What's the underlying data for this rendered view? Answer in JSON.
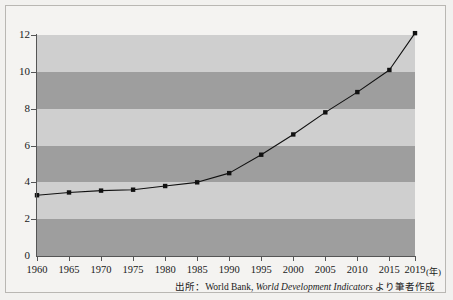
{
  "chart_data": {
    "type": "line",
    "title": "",
    "xlabel": "(年)",
    "ylabel": "",
    "x": [
      1960,
      1965,
      1970,
      1975,
      1980,
      1985,
      1990,
      1995,
      2000,
      2005,
      2010,
      2015,
      2019
    ],
    "values": [
      3.3,
      3.45,
      3.55,
      3.6,
      3.8,
      4.0,
      4.5,
      5.5,
      6.6,
      7.8,
      8.9,
      10.1,
      12.1
    ],
    "series": [
      {
        "name": "",
        "values": [
          3.3,
          3.45,
          3.55,
          3.6,
          3.8,
          4.0,
          4.5,
          5.5,
          6.6,
          7.8,
          8.9,
          10.1,
          12.1
        ]
      }
    ],
    "xtick_labels": [
      "1960",
      "1965",
      "1970",
      "1975",
      "1980",
      "1985",
      "1990",
      "1995",
      "2000",
      "2005",
      "2010",
      "2015",
      "2019"
    ],
    "ytick_labels": [
      "0",
      "2",
      "4",
      "6",
      "8",
      "10",
      "12"
    ],
    "ytick_values": [
      0,
      2,
      4,
      6,
      8,
      10,
      12
    ],
    "ylim": [
      0,
      12
    ],
    "xlim": [
      1960,
      2019
    ],
    "grid": false,
    "banded_background": true,
    "band_colors": {
      "dark": "#9e9e9e",
      "light": "#cfcfcf"
    },
    "marker": "square",
    "marker_color": "#111111",
    "line_color": "#111111",
    "legend": null
  },
  "axis": {
    "y_unit": "",
    "x_unit": "(年)"
  },
  "source": {
    "prefix": "出所：World Bank, ",
    "italic": "World Development Indicators",
    "suffix": " より筆者作成"
  }
}
